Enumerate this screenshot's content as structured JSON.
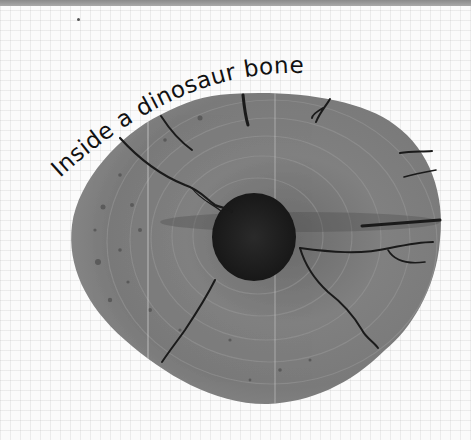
{
  "image": {
    "title": "Inside a dinosaur bone",
    "subject": "dinosaur-bone-cross-section",
    "background": "grid-paper",
    "colors": {
      "bone": "#7d7d7d",
      "marrow_cavity": "#1e1e1e",
      "cracks": "#1a1a1a",
      "text": "#111111",
      "top_strip": "#959595"
    }
  }
}
